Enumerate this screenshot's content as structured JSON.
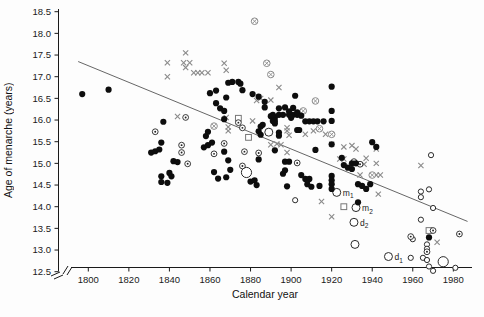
{
  "figure": {
    "background": "#fdfdfd"
  },
  "chart_data": {
    "type": "scatter",
    "title": "",
    "xlabel": "Calendar year",
    "ylabel": "Age of menarche (years)",
    "xlim": [
      1788,
      1990
    ],
    "ylim": [
      12.4,
      18.6
    ],
    "x_ticks": [
      1800,
      1820,
      1840,
      1860,
      1880,
      1900,
      1920,
      1940,
      1960,
      1980
    ],
    "y_ticks": [
      12.5,
      13.0,
      13.5,
      14.0,
      14.5,
      15.0,
      15.5,
      16.0,
      16.5,
      17.0,
      17.5,
      18.0,
      18.5
    ],
    "grid": false,
    "axis_break": true,
    "legend": "none",
    "trend_line": {
      "x1": 1795,
      "y1": 17.35,
      "x2": 1987,
      "y2": 13.66,
      "color": "#555555"
    },
    "colors": {
      "filled": "#0d0d0d",
      "open": "#2a2a2a",
      "gray": "#8a8a8a",
      "square": "#777777"
    },
    "series": [
      {
        "name": "filled-circle",
        "marker": "filled_circle",
        "color": "#0d0d0d",
        "size": 3.1,
        "points": [
          [
            1797,
            16.6
          ],
          [
            1810,
            16.7
          ],
          [
            1831,
            15.25
          ],
          [
            1833,
            15.28
          ],
          [
            1835,
            15.32
          ],
          [
            1836,
            15.48
          ],
          [
            1837,
            15.96
          ],
          [
            1842,
            15.05
          ],
          [
            1844,
            15.03
          ],
          [
            1836,
            14.7
          ],
          [
            1836,
            14.57
          ],
          [
            1839,
            14.55
          ],
          [
            1840,
            14.78
          ],
          [
            1841,
            14.7
          ],
          [
            1857,
            15.37
          ],
          [
            1858,
            15.63
          ],
          [
            1859,
            15.42
          ],
          [
            1859,
            15.73
          ],
          [
            1861,
            15.48
          ],
          [
            1862,
            14.8
          ],
          [
            1864,
            14.65
          ],
          [
            1868,
            14.68
          ],
          [
            1870,
            14.85
          ],
          [
            1867,
            15.27
          ],
          [
            1869,
            15.07
          ],
          [
            1867,
            16.02
          ],
          [
            1860,
            16.62
          ],
          [
            1863,
            16.68
          ],
          [
            1863,
            16.39
          ],
          [
            1865,
            16.27
          ],
          [
            1867,
            16.21
          ],
          [
            1868,
            16.52
          ],
          [
            1869,
            16.86
          ],
          [
            1871,
            16.88
          ],
          [
            1874,
            16.88
          ],
          [
            1875,
            16.84
          ],
          [
            1876,
            16.69
          ],
          [
            1881,
            16.6
          ],
          [
            1884,
            16.54
          ],
          [
            1887,
            16.42
          ],
          [
            1887,
            16.29
          ],
          [
            1885,
            15.85
          ],
          [
            1886,
            15.89
          ],
          [
            1884,
            15.74
          ],
          [
            1885,
            15.66
          ],
          [
            1884,
            15.09
          ],
          [
            1880,
            14.58
          ],
          [
            1882,
            14.61
          ],
          [
            1883,
            14.5
          ],
          [
            1890,
            16.09
          ],
          [
            1891,
            15.98
          ],
          [
            1892,
            16.06
          ],
          [
            1891,
            16.12
          ],
          [
            1894,
            16.12
          ],
          [
            1896,
            16.12
          ],
          [
            1899,
            16.12
          ],
          [
            1901,
            16.12
          ],
          [
            1903,
            16.12
          ],
          [
            1892,
            15.98
          ],
          [
            1892,
            15.92
          ],
          [
            1894,
            16.27
          ],
          [
            1897,
            16.29
          ],
          [
            1894,
            15.71
          ],
          [
            1894,
            15.64
          ],
          [
            1892,
            15.3
          ],
          [
            1896,
            14.76
          ],
          [
            1897,
            14.84
          ],
          [
            1898,
            14.47
          ],
          [
            1897,
            15.04
          ],
          [
            1899,
            15.04
          ],
          [
            1902,
            16.56
          ],
          [
            1899,
            16.2
          ],
          [
            1901,
            16.28
          ],
          [
            1900,
            16.05
          ],
          [
            1903,
            16.18
          ],
          [
            1905,
            16.1
          ],
          [
            1903,
            15.77
          ],
          [
            1904,
            15.77
          ],
          [
            1907,
            15.97
          ],
          [
            1909,
            15.97
          ],
          [
            1911,
            15.97
          ],
          [
            1913,
            15.97
          ],
          [
            1916,
            15.97
          ],
          [
            1905,
            14.73
          ],
          [
            1907,
            14.64
          ],
          [
            1909,
            14.64
          ],
          [
            1908,
            14.52
          ],
          [
            1910,
            14.46
          ],
          [
            1920,
            16.77
          ],
          [
            1920,
            16.21
          ],
          [
            1920,
            15.98
          ],
          [
            1920,
            15.44
          ],
          [
            1912,
            15.31
          ],
          [
            1914,
            14.48
          ],
          [
            1920,
            14.71
          ],
          [
            1920,
            14.61
          ],
          [
            1920,
            14.52
          ],
          [
            1920,
            14.41
          ],
          [
            1925,
            15.13
          ],
          [
            1926,
            14.96
          ],
          [
            1928,
            14.9
          ],
          [
            1930,
            14.87
          ],
          [
            1930,
            15.0
          ],
          [
            1932,
            15.0
          ],
          [
            1933,
            14.52
          ],
          [
            1935,
            14.48
          ],
          [
            1937,
            14.41
          ],
          [
            1939,
            14.52
          ],
          [
            1933,
            14.1
          ],
          [
            1940,
            15.49
          ],
          [
            1942,
            15.38
          ],
          [
            1968,
            13.29
          ]
        ]
      },
      {
        "name": "open-circle-small",
        "marker": "open_circle",
        "color": "#2a2a2a",
        "size": 2.6,
        "points": [
          [
            1902,
            14.15
          ],
          [
            1969,
            15.19
          ],
          [
            1964,
            14.35
          ],
          [
            1968,
            14.4
          ],
          [
            1970,
            13.97
          ],
          [
            1964,
            14.22
          ],
          [
            1964,
            13.7
          ],
          [
            1960,
            13.25
          ],
          [
            1959,
            12.82
          ],
          [
            1967,
            13.13
          ],
          [
            1967,
            13.03
          ],
          [
            1965,
            12.82
          ],
          [
            1967,
            12.77
          ],
          [
            1968,
            12.62
          ],
          [
            1970,
            12.52
          ],
          [
            1981,
            12.59
          ]
        ]
      },
      {
        "name": "open-circle-medium",
        "marker": "open_circle",
        "color": "#2a2a2a",
        "size": 4.0,
        "points": [
          [
            1889,
            15.72
          ],
          [
            1922.5,
            14.33
          ],
          [
            1932,
            13.98
          ],
          [
            1931,
            13.64
          ],
          [
            1931.5,
            13.13
          ],
          [
            1948,
            12.85
          ]
        ]
      },
      {
        "name": "open-circle-large",
        "marker": "open_circle",
        "color": "#2a2a2a",
        "size": 5.1,
        "points": [
          [
            1878,
            14.79
          ],
          [
            1975,
            12.73
          ]
        ]
      },
      {
        "name": "circled-dot",
        "marker": "circled_dot",
        "color": "#222222",
        "size": 2.9,
        "points": [
          [
            1833,
            15.73
          ],
          [
            1846,
            15.42
          ],
          [
            1846,
            15.25
          ],
          [
            1848,
            16.06
          ],
          [
            1849,
            14.99
          ],
          [
            1862,
            15.22
          ],
          [
            1867,
            15.46
          ],
          [
            1874,
            15.94
          ],
          [
            1876,
            15.82
          ],
          [
            1877,
            15.27
          ],
          [
            1876,
            14.94
          ],
          [
            1884,
            15.24
          ],
          [
            1903,
            15.01
          ],
          [
            1931,
            15.04
          ],
          [
            1934,
            14.98
          ],
          [
            1959,
            13.31
          ],
          [
            1967,
            12.96
          ],
          [
            1970,
            13.45
          ],
          [
            1983,
            13.37
          ]
        ]
      },
      {
        "name": "circled-x",
        "marker": "circled_x",
        "color": "#8a8a8a",
        "size": 3.3,
        "points": [
          [
            1882,
            18.28
          ],
          [
            1888,
            17.31
          ],
          [
            1890,
            17.05
          ],
          [
            1862,
            15.86
          ],
          [
            1906,
            16.21
          ],
          [
            1912,
            16.44
          ],
          [
            1914,
            15.8
          ],
          [
            1920,
            15.67
          ],
          [
            1940,
            14.73
          ]
        ]
      },
      {
        "name": "x-mark",
        "marker": "x",
        "color": "#8a8a8a",
        "size": 2.6,
        "points": [
          [
            1839,
            17.32
          ],
          [
            1839,
            17.0
          ],
          [
            1844,
            16.08
          ],
          [
            1848,
            17.55
          ],
          [
            1847,
            17.32
          ],
          [
            1850,
            17.32
          ],
          [
            1848,
            17.21
          ],
          [
            1852,
            17.09
          ],
          [
            1854,
            17.09
          ],
          [
            1856,
            17.09
          ],
          [
            1859,
            17.09
          ],
          [
            1867,
            17.31
          ],
          [
            1868,
            17.15
          ],
          [
            1868,
            16.06
          ],
          [
            1869,
            15.84
          ],
          [
            1869,
            15.75
          ],
          [
            1883,
            16.45
          ],
          [
            1885,
            16.5
          ],
          [
            1890,
            16.46
          ],
          [
            1894,
            16.75
          ],
          [
            1881,
            15.98
          ],
          [
            1890,
            15.43
          ],
          [
            1893,
            15.45
          ],
          [
            1895,
            15.43
          ],
          [
            1898,
            15.25
          ],
          [
            1898,
            15.82
          ],
          [
            1898,
            15.75
          ],
          [
            1899,
            15.65
          ],
          [
            1907,
            15.67
          ],
          [
            1911,
            15.75
          ],
          [
            1917,
            15.67
          ],
          [
            1920,
            15.44
          ],
          [
            1924,
            15.1
          ],
          [
            1926,
            15.1
          ],
          [
            1926,
            15.38
          ],
          [
            1930,
            15.41
          ],
          [
            1932,
            15.33
          ],
          [
            1937,
            15.12
          ],
          [
            1942,
            15.33
          ],
          [
            1942,
            15.0
          ],
          [
            1936,
            14.98
          ],
          [
            1934,
            14.73
          ],
          [
            1942,
            14.73
          ],
          [
            1944,
            14.73
          ],
          [
            1943,
            14.29
          ],
          [
            1915,
            14.12
          ],
          [
            1920,
            13.77
          ],
          [
            1964,
            14.95
          ],
          [
            1972,
            13.18
          ]
        ]
      },
      {
        "name": "open-square",
        "marker": "square",
        "color": "#777777",
        "size": 2.9,
        "points": [
          [
            1874,
            16.04
          ],
          [
            1879,
            15.6
          ],
          [
            1926,
            14.0
          ],
          [
            1968,
            13.45
          ]
        ]
      }
    ],
    "annotations": [
      {
        "text": "m",
        "sub": "1",
        "x": 1925.5,
        "y": 14.31
      },
      {
        "text": "m",
        "sub": "2",
        "x": 1935.0,
        "y": 13.96
      },
      {
        "text": "d",
        "sub": "2",
        "x": 1934.0,
        "y": 13.62
      },
      {
        "text": "d",
        "sub": "1",
        "x": 1951.0,
        "y": 12.83
      }
    ]
  }
}
